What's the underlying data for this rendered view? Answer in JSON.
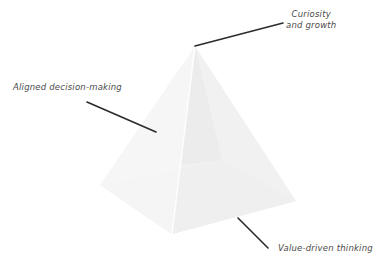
{
  "diagram": {
    "type": "pyramid",
    "colors": {
      "background": "#ffffff",
      "leader_line": "#2b2b2b",
      "label_text": "#4a4a4a",
      "face_left": "#f4f4f4",
      "face_right": "#f1f1f1",
      "face_front": "#eeeeee",
      "base_inner": "#e6e6e6"
    },
    "labels": {
      "top": {
        "line1": "Curiosity",
        "line2": "and growth"
      },
      "left": {
        "text": "Aligned decision-making"
      },
      "bottom": {
        "text": "Value-driven thinking"
      }
    }
  }
}
